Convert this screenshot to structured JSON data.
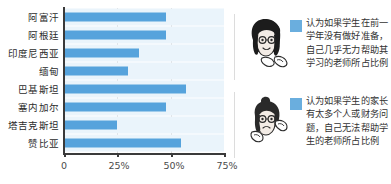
{
  "chart_data": {
    "type": "bar",
    "orientation": "horizontal",
    "title": "",
    "xlabel": "",
    "ylabel": "",
    "categories": [
      "阿富汗",
      "阿根廷",
      "印度尼西亚",
      "缅甸",
      "巴基斯坦",
      "塞内加尔",
      "塔吉克斯坦",
      "赞比亚"
    ],
    "values": [
      48,
      48,
      35,
      30,
      57,
      48,
      25,
      55
    ],
    "series": [
      {
        "name": "认为如果学生在前一学年没有做好准备，自己几乎无力帮助其学习的老师所占比例",
        "values": [
          48,
          48,
          35,
          30,
          57,
          48,
          25,
          55
        ]
      }
    ],
    "xlim": [
      0,
      75
    ],
    "xticks": [
      0,
      25,
      50,
      75
    ],
    "xtick_labels": [
      "0",
      "25%",
      "50%",
      "75%"
    ],
    "grid": true,
    "legend_position": "right",
    "bar_color": "#56a3dc",
    "band_color": "#eaf4fb"
  },
  "axis": {
    "ticks": [
      {
        "label": "0",
        "value": 0
      },
      {
        "label": "25%",
        "value": 25
      },
      {
        "label": "50%",
        "value": 50
      },
      {
        "label": "75%",
        "value": 75
      }
    ]
  },
  "legend": {
    "items": [
      {
        "swatch_color": "#6aaede",
        "avatar_name": "teacher-avatar-bob-hair",
        "text": "认为如果学生在前一学年没有做好准备，自己几乎无力帮助其学习的老师所占比例"
      },
      {
        "swatch_color": "#6aaede",
        "avatar_name": "teacher-avatar-bun-hair",
        "text": "认为如果学生的家长有太多个人或财务问题，自己无法帮助学生的老师所占比例"
      }
    ]
  }
}
